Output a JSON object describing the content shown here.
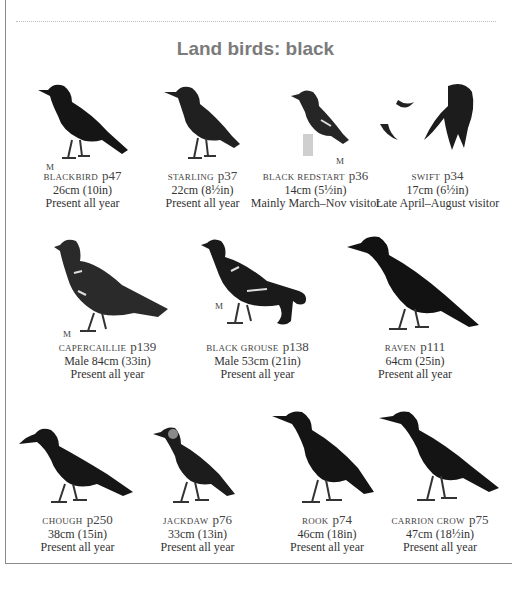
{
  "page": {
    "title": "Land birds: black",
    "male_marker": "M",
    "rows": [
      [
        {
          "name": "Blackbird",
          "page": "p47",
          "size": "26cm (10in)",
          "status": "Present all year",
          "icon": "blackbird-illustration"
        },
        {
          "name": "Starling",
          "page": "p37",
          "size": "22cm (8½in)",
          "status": "Present all year",
          "icon": "starling-illustration"
        },
        {
          "name": "Black redstart",
          "page": "p36",
          "size": "14cm (5½in)",
          "status": "Mainly March–Nov visitor",
          "icon": "black-redstart-illustration"
        },
        {
          "name": "Swift",
          "page": "p34",
          "size": "17cm (6½in)",
          "status": "Late April–August visitor",
          "icon": "swift-illustration"
        }
      ],
      [
        {
          "name": "Capercaillie",
          "page": "p139",
          "size": "Male 84cm (33in)",
          "status": "Present all year",
          "icon": "capercaillie-illustration"
        },
        {
          "name": "Black grouse",
          "page": "p138",
          "size": "Male 53cm (21in)",
          "status": "Present all year",
          "icon": "black-grouse-illustration"
        },
        {
          "name": "Raven",
          "page": "p111",
          "size": "64cm (25in)",
          "status": "Present all year",
          "icon": "raven-illustration"
        }
      ],
      [
        {
          "name": "Chough",
          "page": "p250",
          "size": "38cm (15in)",
          "status": "Present all year",
          "icon": "chough-illustration"
        },
        {
          "name": "Jackdaw",
          "page": "p76",
          "size": "33cm (13in)",
          "status": "Present all year",
          "icon": "jackdaw-illustration"
        },
        {
          "name": "Rook",
          "page": "p74",
          "size": "46cm (18in)",
          "status": "Present all year",
          "icon": "rook-illustration"
        },
        {
          "name": "Carrion crow",
          "page": "p75",
          "size": "47cm (18½in)",
          "status": "Present all year",
          "icon": "carrion-crow-illustration"
        }
      ]
    ]
  }
}
